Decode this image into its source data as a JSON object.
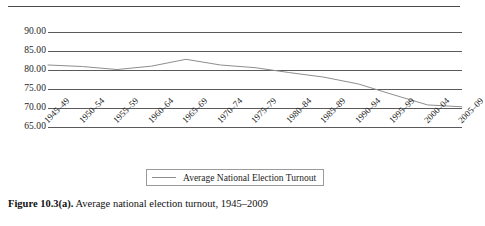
{
  "top_rule": {
    "name": "page-rule"
  },
  "chart_data": {
    "type": "line",
    "title": "",
    "xlabel": "",
    "ylabel": "",
    "ylim": [
      65.0,
      90.0
    ],
    "ytick_labels": [
      "90.00",
      "85.00",
      "80.00",
      "75.00",
      "70.00",
      "65.00"
    ],
    "ytick_values": [
      90.0,
      85.0,
      80.0,
      75.0,
      70.0,
      65.0
    ],
    "grid": true,
    "legend_position": "bottom-center",
    "categories": [
      "1945–49",
      "1950–54",
      "1955–59",
      "1960–64",
      "1965–69",
      "1970–74",
      "1975–79",
      "1980–84",
      "1985–89",
      "1990–94",
      "1995–99",
      "2000–04",
      "2005–09"
    ],
    "series": [
      {
        "name": "Average National Election Turnout",
        "color": "#8e8e8e",
        "values": [
          85.0,
          84.6,
          83.8,
          84.7,
          86.5,
          85.0,
          84.3,
          83.0,
          81.8,
          80.0,
          77.2,
          74.5,
          74.0
        ]
      }
    ]
  },
  "legend": {
    "label": "Average National Election Turnout",
    "swatch_color": "#8e8e8e"
  },
  "caption": {
    "figure_number": "Figure 10.3(a).",
    "text": "Average national election turnout, 1945–2009"
  },
  "colors": {
    "gridline": "#5a5a5a",
    "series_line": "#8e8e8e",
    "text": "#1d1d1d",
    "rule": "#4a4a4a"
  }
}
